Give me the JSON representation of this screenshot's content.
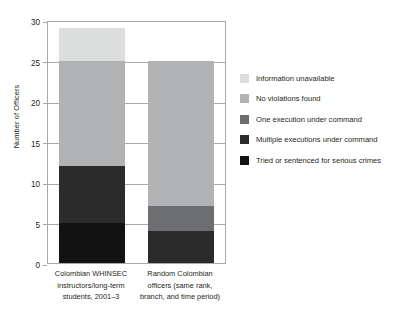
{
  "chart_data": {
    "type": "bar",
    "stacked": true,
    "title": "",
    "xlabel": "",
    "ylabel": "Number of Officers",
    "ylim": [
      0,
      30
    ],
    "ytick_step": 5,
    "yticks": [
      0,
      5,
      10,
      15,
      20,
      25,
      30
    ],
    "grid": true,
    "legend_position": "right",
    "categories": [
      "Colombian WHINSEC instructors/long-term students, 2001–3",
      "Random Colombian officers (same rank, branch, and time period)"
    ],
    "category_lines": [
      [
        "Colombian WHINSEC",
        "instructors/long-term",
        "students, 2001–3"
      ],
      [
        "Random Colombian",
        "officers (same rank,",
        "branch, and time period)"
      ]
    ],
    "series": [
      {
        "name": "Tried or sentenced for serious crimes",
        "color": "#121212",
        "values": [
          5,
          0
        ]
      },
      {
        "name": "Multiple executions under command",
        "color": "#2b2b2b",
        "values": [
          0,
          4
        ]
      },
      {
        "name": "One execution under command",
        "color": "#6d6e71",
        "values": [
          7,
          3
        ]
      },
      {
        "name": "No violations found",
        "color": "#b0b2b3",
        "values": [
          13,
          18
        ]
      },
      {
        "name": "Information unavailable",
        "color": "#dcdddd",
        "values": [
          4,
          0
        ]
      }
    ],
    "totals": [
      29,
      25
    ],
    "stack_breakdown": [
      {
        "category": "Colombian WHINSEC instructors/long-term students, 2001–3",
        "segments": [
          {
            "label": "Tried or sentenced for serious crimes",
            "from": 0,
            "to": 5,
            "value": 5
          },
          {
            "label": "Multiple executions under command",
            "from": 5,
            "to": 12,
            "value": 7
          },
          {
            "label": "No violations found",
            "from": 12,
            "to": 25,
            "value": 13
          },
          {
            "label": "Information unavailable",
            "from": 25,
            "to": 29,
            "value": 4
          }
        ]
      },
      {
        "category": "Random Colombian officers (same rank, branch, and time period)",
        "segments": [
          {
            "label": "Multiple executions under command",
            "from": 0,
            "to": 4,
            "value": 4
          },
          {
            "label": "One execution under command",
            "from": 4,
            "to": 7,
            "value": 3
          },
          {
            "label": "No violations found",
            "from": 7,
            "to": 25,
            "value": 18
          }
        ]
      }
    ]
  },
  "legend": {
    "items": [
      {
        "label": "Information unavailable",
        "color": "#dcdddd"
      },
      {
        "label": "No violations found",
        "color": "#b0b2b3"
      },
      {
        "label": "One execution under command",
        "color": "#6d6e71"
      },
      {
        "label": "Multiple executions under command",
        "color": "#2b2b2b"
      },
      {
        "label": "Tried or sentenced for serious crimes",
        "color": "#121212"
      }
    ]
  },
  "axis": {
    "y_title": "Number of Officers",
    "y_ticks": [
      "30",
      "25",
      "20",
      "15",
      "10",
      "5",
      "0"
    ]
  },
  "colors": {
    "axis": "#a7a9ac",
    "text": "#231f20",
    "background": "#ffffff"
  }
}
